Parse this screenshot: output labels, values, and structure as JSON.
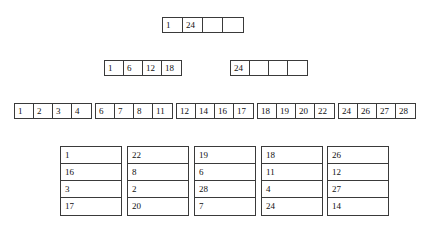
{
  "diagram": {
    "style": {
      "border_color": "#3a3a3a",
      "background": "#ffffff",
      "text_color": "#111111"
    },
    "levels": [
      {
        "name": "root",
        "nodes": [
          {
            "id": "root-node",
            "x": 162,
            "y": 17,
            "cells": [
              "1",
              "24",
              "",
              ""
            ]
          }
        ]
      },
      {
        "name": "level-two",
        "nodes": [
          {
            "id": "level2-node-left",
            "x": 104,
            "y": 60,
            "cells": [
              "1",
              "6",
              "12",
              "18"
            ]
          },
          {
            "id": "level2-node-right",
            "x": 230,
            "y": 60,
            "cells": [
              "24",
              "",
              "",
              ""
            ]
          }
        ]
      },
      {
        "name": "leaf-level",
        "nodes": [
          {
            "id": "leaf-node-1",
            "x": 14,
            "y": 103,
            "cells": [
              "1",
              "2",
              "3",
              "4"
            ]
          },
          {
            "id": "leaf-node-2",
            "x": 95,
            "y": 103,
            "cells": [
              "6",
              "7",
              "8",
              "11"
            ]
          },
          {
            "id": "leaf-node-3",
            "x": 176,
            "y": 103,
            "cells": [
              "12",
              "14",
              "16",
              "17"
            ]
          },
          {
            "id": "leaf-node-4",
            "x": 257,
            "y": 103,
            "cells": [
              "18",
              "19",
              "20",
              "22"
            ]
          },
          {
            "id": "leaf-node-5",
            "x": 338,
            "y": 103,
            "cells": [
              "24",
              "26",
              "27",
              "28"
            ]
          }
        ]
      }
    ],
    "buckets": [
      {
        "id": "bucket-1",
        "x": 60,
        "y": 146,
        "slots": [
          "1",
          "16",
          "3",
          "17"
        ]
      },
      {
        "id": "bucket-2",
        "x": 127,
        "y": 146,
        "slots": [
          "22",
          "8",
          "2",
          "20"
        ]
      },
      {
        "id": "bucket-3",
        "x": 194,
        "y": 146,
        "slots": [
          "19",
          "6",
          "28",
          "7"
        ]
      },
      {
        "id": "bucket-4",
        "x": 261,
        "y": 146,
        "slots": [
          "18",
          "11",
          "4",
          "24"
        ]
      },
      {
        "id": "bucket-5",
        "x": 327,
        "y": 146,
        "slots": [
          "26",
          "12",
          "27",
          "14"
        ]
      }
    ]
  }
}
